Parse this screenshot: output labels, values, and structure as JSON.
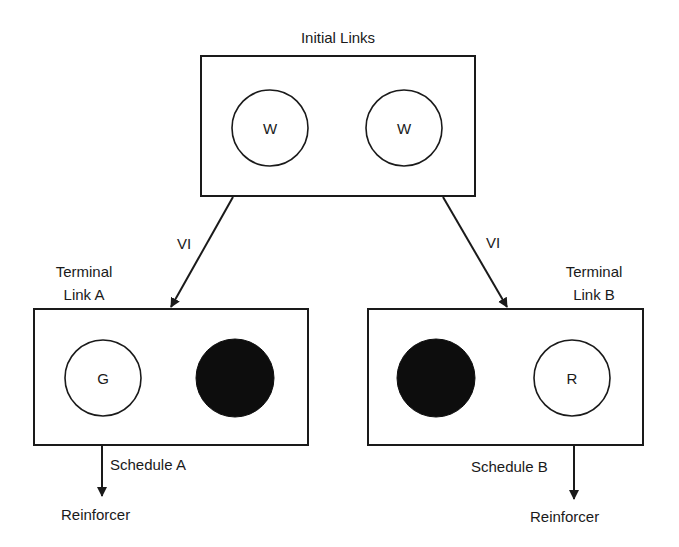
{
  "diagram": {
    "initial": {
      "title": "Initial Links",
      "keys": [
        {
          "label": "W",
          "filled": false
        },
        {
          "label": "W",
          "filled": false
        }
      ]
    },
    "transitions": {
      "left_label": "VI",
      "right_label": "VI"
    },
    "terminal_a": {
      "title_line1": "Terminal",
      "title_line2": "Link A",
      "keys": [
        {
          "label": "G",
          "filled": false
        },
        {
          "label": "",
          "filled": true
        }
      ],
      "schedule": "Schedule A",
      "outcome": "Reinforcer"
    },
    "terminal_b": {
      "title_line1": "Terminal",
      "title_line2": "Link B",
      "keys": [
        {
          "label": "",
          "filled": true
        },
        {
          "label": "R",
          "filled": false
        }
      ],
      "schedule": "Schedule B",
      "outcome": "Reinforcer"
    },
    "colors": {
      "stroke": "#1a1a1a",
      "fill_dark": "#0d0d0d",
      "background": "#ffffff"
    }
  }
}
